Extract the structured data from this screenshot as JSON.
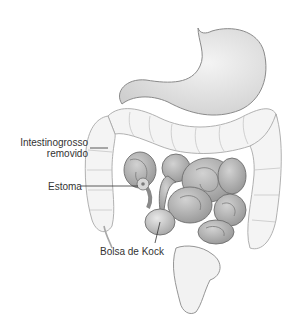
{
  "diagram": {
    "labels": {
      "large_intestine_line1": "Intestinogrosso",
      "large_intestine_line2": "removido",
      "stoma": "Estoma",
      "kock_pouch": "Bolsa de Kock"
    },
    "colors": {
      "background": "#ffffff",
      "outline": "#8a8a8a",
      "removed_colon_fill": "#f4f4f4",
      "small_intestine_fill": "#b8b8b8",
      "stomach_fill": "#e6e6e6",
      "label_text": "#333333"
    }
  }
}
